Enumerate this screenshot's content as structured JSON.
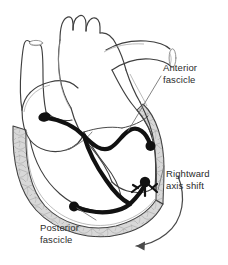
{
  "figure": {
    "type": "anatomical-diagram",
    "background_color": "#ffffff"
  },
  "labels": {
    "anterior": {
      "line1": "Anterior",
      "line2": "fascicle"
    },
    "rightward": {
      "line1": "Rightward",
      "line2": "axis shift"
    },
    "posterior": {
      "line1": "Posterior",
      "line2": "fascicle"
    }
  },
  "colors": {
    "outline": "#3a3a3a",
    "myocardium_fill": "#d9d9d9",
    "trabecula": "#8a8a8a",
    "conduction": "#121212",
    "leader_line": "#6e6e6e",
    "text": "#2b2b2b",
    "chamber_fill": "#ffffff"
  },
  "structures": {
    "great_vessels": [
      "aortic-arch",
      "superior-vena-cava",
      "pulmonary-artery"
    ],
    "chambers": [
      "right-atrium",
      "left-atrium",
      "right-ventricle",
      "left-ventricle"
    ],
    "conduction_nodes": [
      "av-node",
      "anterior-fascicle-terminus",
      "purkinje-terminus-right",
      "posterior-fascicle-terminus"
    ],
    "arrow": "rightward-axis-shift-arrow"
  }
}
